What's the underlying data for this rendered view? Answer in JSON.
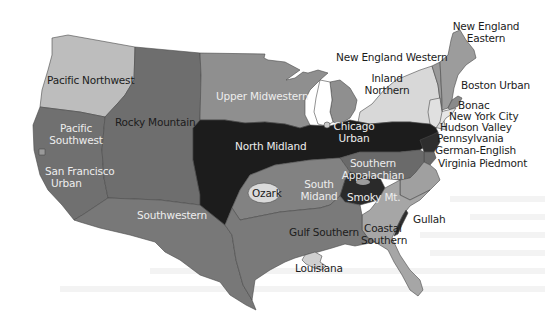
{
  "map": {
    "title": "American English dialect regions",
    "colors": {
      "background": "#ffffff",
      "darkest": "#1a1a1a",
      "dark": "#5e5e5e",
      "mid_dark": "#767676",
      "mid": "#8c8c8c",
      "mid_light": "#a3a3a3",
      "light": "#bdbdbd",
      "lightest": "#dcdcdc",
      "border": "#4a4a4a"
    },
    "regions": {
      "pacific_northwest": "Pacific Northwest",
      "pacific_southwest": {
        "line1": "Pacific",
        "line2": "Southwest"
      },
      "san_francisco_urban": {
        "line1": "San Francisco",
        "line2": "Urban"
      },
      "rocky_mountain": "Rocky Mountain",
      "southwestern": "Southwestern",
      "upper_midwestern": "Upper Midwestern",
      "north_midland": "North Midland",
      "chicago_urban": {
        "line1": "Chicago",
        "line2": "Urban"
      },
      "ozark": "Ozark",
      "south_midland": {
        "line1": "South",
        "line2": "Midand"
      },
      "southern_appalachian": {
        "line1": "Southern",
        "line2": "Appalachian"
      },
      "smoky_mt": "Smoky Mt.",
      "gulf_southern": "Gulf Southern",
      "louisiana": "Louisiana",
      "coastal_southern": {
        "line1": "Coastal",
        "line2": "Southern"
      },
      "gullah": "Gullah",
      "new_england_eastern": {
        "line1": "New England",
        "line2": "Eastern"
      },
      "new_england_western": "New England Western",
      "inland_northern": {
        "line1": "Inland",
        "line2": "Northern"
      },
      "boston_urban": "Boston Urban",
      "bonac": "Bonac",
      "new_york_city": "New York City",
      "hudson_valley": "Hudson Valley",
      "pennsylvania": "Pennsylvania",
      "german_english": "German-English",
      "virginia_piedmont": "Virginia Piedmont"
    }
  }
}
